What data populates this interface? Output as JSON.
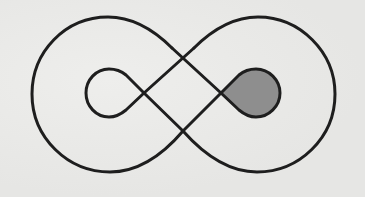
{
  "figure": {
    "type": "knot-diagram",
    "colors": {
      "background": "#e9e9e7",
      "stroke": "#1e1e1e",
      "shaded_fill": "#8e8e8e"
    },
    "stroke_width": 3,
    "elements": {
      "outer_left_lobe": "outer-left-arc",
      "outer_right_lobe": "outer-right-arc",
      "inner_left_loop": "unshaded teardrop",
      "inner_right_loop": "shaded teardrop",
      "crossings": 3
    }
  }
}
